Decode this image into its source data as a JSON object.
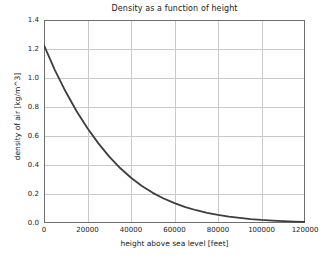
{
  "chart_data": {
    "type": "line",
    "title": "Density as a function of height",
    "xlabel": "height above sea level [feet]",
    "ylabel": "density of air [kg/m^3]",
    "xlim": [
      0,
      120000
    ],
    "ylim": [
      0,
      1.4
    ],
    "grid": true,
    "legend": null,
    "line_color": "#3d3d3d",
    "line_width": 1.8,
    "xticks": [
      0,
      20000,
      40000,
      60000,
      80000,
      100000,
      120000
    ],
    "xtick_labels": [
      "0",
      "20000",
      "40000",
      "60000",
      "80000",
      "100000",
      "120000"
    ],
    "yticks": [
      0.0,
      0.2,
      0.4,
      0.6,
      0.8,
      1.0,
      1.2,
      1.4
    ],
    "ytick_labels": [
      "0.0",
      "0.2",
      "0.4",
      "0.6",
      "0.8",
      "1.0",
      "1.2",
      "1.4"
    ],
    "series": [
      {
        "name": "air density",
        "x": [
          0,
          5000,
          10000,
          15000,
          20000,
          25000,
          30000,
          35000,
          40000,
          45000,
          50000,
          55000,
          60000,
          65000,
          70000,
          75000,
          80000,
          85000,
          90000,
          95000,
          100000,
          105000,
          110000,
          115000,
          120000
        ],
        "y": [
          1.225,
          1.055,
          0.905,
          0.771,
          0.653,
          0.549,
          0.458,
          0.379,
          0.312,
          0.255,
          0.208,
          0.169,
          0.137,
          0.11,
          0.088,
          0.07,
          0.056,
          0.044,
          0.035,
          0.027,
          0.021,
          0.017,
          0.013,
          0.01,
          0.008
        ]
      }
    ]
  }
}
